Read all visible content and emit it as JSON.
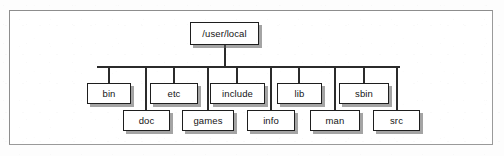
{
  "figure": {
    "type": "directory-tree-diagram",
    "title": "",
    "frame": {
      "visible": true,
      "border_color": "#8d8d8d"
    },
    "style": {
      "box_border_color": "#1e1e1e",
      "box_fill_color": "#ffffff",
      "line_color": "#2b2b2b",
      "shadow_color": "#5a5a5a",
      "text_color": "#141414"
    }
  },
  "tree": {
    "root": {
      "label": "/user/local",
      "box": {
        "x": 190,
        "y": 22,
        "w": 69,
        "h": 23
      }
    },
    "bus": {
      "x1": 97,
      "x2": 400,
      "y": 66
    },
    "children": [
      {
        "label": "bin",
        "row": "upper",
        "box": {
          "x": 87,
          "y": 83,
          "w": 44,
          "h": 21
        },
        "drop_x": 109
      },
      {
        "label": "doc",
        "row": "lower",
        "box": {
          "x": 123,
          "y": 110,
          "w": 47,
          "h": 21
        },
        "drop_x": 146
      },
      {
        "label": "etc",
        "row": "upper",
        "box": {
          "x": 150,
          "y": 83,
          "w": 48,
          "h": 21
        },
        "drop_x": 174
      },
      {
        "label": "games",
        "row": "lower",
        "box": {
          "x": 182,
          "y": 110,
          "w": 52,
          "h": 21
        },
        "drop_x": 208
      },
      {
        "label": "include",
        "row": "upper",
        "box": {
          "x": 210,
          "y": 83,
          "w": 55,
          "h": 21
        },
        "drop_x": 237
      },
      {
        "label": "info",
        "row": "lower",
        "box": {
          "x": 247,
          "y": 110,
          "w": 48,
          "h": 21
        },
        "drop_x": 271
      },
      {
        "label": "lib",
        "row": "upper",
        "box": {
          "x": 277,
          "y": 83,
          "w": 45,
          "h": 21
        },
        "drop_x": 299
      },
      {
        "label": "man",
        "row": "lower",
        "box": {
          "x": 310,
          "y": 110,
          "w": 50,
          "h": 21
        },
        "drop_x": 335
      },
      {
        "label": "sbin",
        "row": "upper",
        "box": {
          "x": 339,
          "y": 83,
          "w": 50,
          "h": 21
        },
        "drop_x": 364
      },
      {
        "label": "src",
        "row": "lower",
        "box": {
          "x": 373,
          "y": 110,
          "w": 47,
          "h": 21
        },
        "drop_x": 397
      }
    ]
  },
  "chart_data": {
    "type": "diagram",
    "subtype": "tree",
    "nodes": [
      "/user/local",
      "bin",
      "doc",
      "etc",
      "games",
      "include",
      "info",
      "lib",
      "man",
      "sbin",
      "src"
    ],
    "edges": [
      [
        "/user/local",
        "bin"
      ],
      [
        "/user/local",
        "doc"
      ],
      [
        "/user/local",
        "etc"
      ],
      [
        "/user/local",
        "games"
      ],
      [
        "/user/local",
        "include"
      ],
      [
        "/user/local",
        "info"
      ],
      [
        "/user/local",
        "lib"
      ],
      [
        "/user/local",
        "man"
      ],
      [
        "/user/local",
        "sbin"
      ],
      [
        "/user/local",
        "src"
      ]
    ],
    "levels": 2,
    "child_count": 10,
    "layout": "horizontal-bus with staggered two-row children"
  }
}
